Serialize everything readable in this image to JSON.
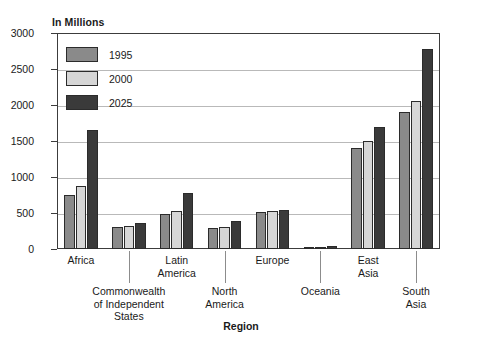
{
  "chart_data": {
    "type": "bar",
    "title": "",
    "xlabel": "Region",
    "ylabel": "In Millions",
    "ylim": [
      0,
      3000
    ],
    "ytick_step": 500,
    "yticks": [
      "0",
      "500",
      "1000",
      "1500",
      "2000",
      "2500",
      "3000"
    ],
    "grid": true,
    "legend_position": "top-left inside plot",
    "categories": [
      "Africa",
      "Commonwealth\nof Independent\nStates",
      "Latin\nAmerica",
      "North\nAmerica",
      "Europe",
      "Oceania",
      "East\nAsia",
      "South\nAsia"
    ],
    "category_labels": [
      {
        "text": "Africa",
        "lines": [
          "Africa"
        ],
        "row": 0
      },
      {
        "text": "Commonwealth of Independent States",
        "lines": [
          "Commonwealth",
          "of Independent",
          "States"
        ],
        "row": 1
      },
      {
        "text": "Latin America",
        "lines": [
          "Latin",
          "America"
        ],
        "row": 0
      },
      {
        "text": "North America",
        "lines": [
          "North",
          "America"
        ],
        "row": 1
      },
      {
        "text": "Europe",
        "lines": [
          "Europe"
        ],
        "row": 0
      },
      {
        "text": "Oceania",
        "lines": [
          "Oceania"
        ],
        "row": 1
      },
      {
        "text": "East Asia",
        "lines": [
          "East",
          "Asia"
        ],
        "row": 0
      },
      {
        "text": "South Asia",
        "lines": [
          "South",
          "Asia"
        ],
        "row": 1
      }
    ],
    "series": [
      {
        "name": "1995",
        "color": "#8a8a8a",
        "values": [
          750,
          300,
          480,
          290,
          510,
          30,
          1400,
          1900
        ]
      },
      {
        "name": "2000",
        "color": "#d6d6d6",
        "values": [
          880,
          320,
          525,
          310,
          530,
          32,
          1500,
          2050
        ]
      },
      {
        "name": "2025",
        "color": "#3a3a3a",
        "values": [
          1650,
          360,
          780,
          385,
          540,
          45,
          1700,
          2780
        ]
      }
    ]
  },
  "legend": {
    "entries": [
      {
        "label": "1995"
      },
      {
        "label": "2000"
      },
      {
        "label": "2025"
      }
    ]
  },
  "axis": {
    "y_unit_caption": "In Millions",
    "x_title": "Region"
  },
  "colors": {
    "series_1995": "#8a8a8a",
    "series_2000": "#d6d6d6",
    "series_2025": "#3a3a3a",
    "frame": "#3c3c3c",
    "gridline": "#b9b9b9",
    "background": "#ffffff"
  }
}
